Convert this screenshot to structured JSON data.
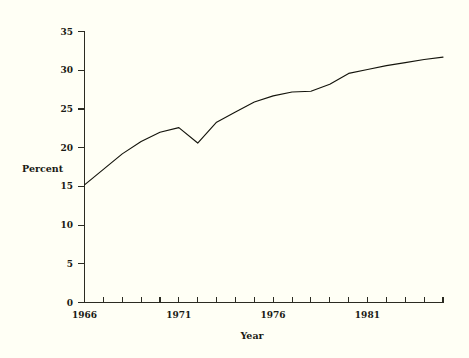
{
  "chart_data": {
    "type": "line",
    "title": "",
    "subtitle": "",
    "xlabel": "Year",
    "ylabel": "Percent",
    "xlim": [
      1966,
      1985
    ],
    "ylim": [
      0,
      35
    ],
    "grid": false,
    "legend": false,
    "legend_position": "none",
    "y_ticks": [
      0,
      5,
      10,
      15,
      20,
      25,
      30,
      35
    ],
    "y_tick_labels": [
      "0",
      "5",
      "10",
      "15",
      "20",
      "25",
      "30",
      "35"
    ],
    "x_ticks": [
      1966,
      1967,
      1968,
      1969,
      1970,
      1971,
      1972,
      1973,
      1974,
      1975,
      1976,
      1977,
      1978,
      1979,
      1980,
      1981,
      1982,
      1983,
      1984,
      1985
    ],
    "x_tick_labels": [
      "1966",
      "",
      "",
      "",
      "",
      "1971",
      "",
      "",
      "",
      "",
      "1976",
      "",
      "",
      "",
      "",
      "1981",
      "",
      "",
      "",
      ""
    ],
    "x_labeled_ticks": [
      "1966",
      "1971",
      "1976",
      "1981"
    ],
    "series": [
      {
        "name": "Percent",
        "color": "#14140c",
        "x": [
          1966,
          1967,
          1968,
          1969,
          1970,
          1971,
          1972,
          1973,
          1974,
          1975,
          1976,
          1977,
          1978,
          1979,
          1980,
          1981,
          1982,
          1983,
          1984,
          1985
        ],
        "values": [
          15.2,
          17.2,
          19.2,
          20.8,
          22.0,
          22.6,
          20.6,
          23.3,
          24.6,
          25.9,
          26.7,
          27.2,
          27.3,
          28.2,
          29.6,
          30.1,
          30.6,
          31.0,
          31.4,
          31.7
        ]
      }
    ]
  },
  "axes": {
    "y_axis_title": "Percent",
    "x_axis_title": "Year"
  },
  "colors": {
    "background": "#fffff5",
    "ink": "#1a1a14",
    "line": "#14140c"
  }
}
